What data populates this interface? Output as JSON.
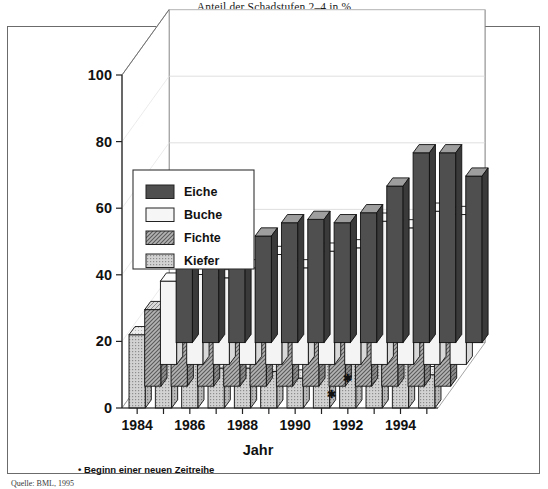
{
  "title": "Anteil der Schadstufen 2–4 in %",
  "footnote": "• Beginn einer neuen Zeitreihe",
  "source": "Quelle: BML, 1995",
  "axis": {
    "x_title": "Jahr",
    "y_ticks": [
      "0",
      "20",
      "40",
      "60",
      "80",
      "100"
    ],
    "x_ticks_shown": [
      "1984",
      "1986",
      "1988",
      "1990",
      "1992",
      "1994"
    ]
  },
  "legend": {
    "items": [
      {
        "label": "Eiche",
        "color": "#4a4a4a",
        "pattern": "solid-dark"
      },
      {
        "label": "Buche",
        "color": "#f2f2f2",
        "pattern": "plain-light"
      },
      {
        "label": "Fichte",
        "color": "#9a9a9a",
        "pattern": "hatch-medium"
      },
      {
        "label": "Kiefer",
        "color": "#c8c8c8",
        "pattern": "dots-light"
      }
    ]
  },
  "chart_data": {
    "type": "bar",
    "title": "Anteil der Schadstufen 2–4 in %",
    "xlabel": "Jahr",
    "ylabel": "",
    "ylim": [
      0,
      100
    ],
    "grid": true,
    "legend_position": "inside-upper-left",
    "three_d": true,
    "annotations": [
      {
        "text": "•",
        "at_category": "1991",
        "note": "Beginn einer neuen Zeitreihe"
      }
    ],
    "categories": [
      "1984",
      "1985",
      "1986",
      "1987",
      "1988",
      "1989",
      "1990",
      "1991",
      "1992",
      "1993",
      "1994",
      "1995"
    ],
    "series": [
      {
        "name": "Eiche",
        "color": "#4a4a4a",
        "values": [
          25,
          28,
          27,
          32,
          36,
          37,
          36,
          39,
          47,
          57,
          57,
          50
        ]
      },
      {
        "name": "Buche",
        "color": "#f2f2f2",
        "values": [
          25,
          27,
          26,
          29,
          33,
          29,
          34,
          35,
          43,
          41,
          46,
          45
        ]
      },
      {
        "name": "Fichte",
        "color": "#9a9a9a",
        "values": [
          23,
          28,
          31,
          27,
          31,
          27,
          30,
          35,
          32,
          31,
          27,
          34
        ]
      },
      {
        "name": "Kiefer",
        "color": "#c8c8c8",
        "values": [
          22,
          19,
          16,
          12,
          12,
          11,
          9,
          25,
          24,
          20,
          15,
          10
        ]
      }
    ]
  }
}
